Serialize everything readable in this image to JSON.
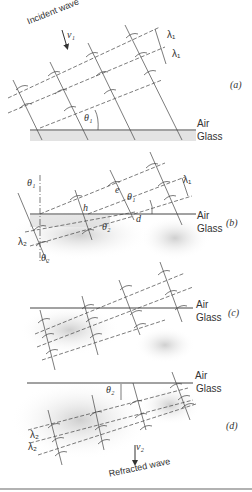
{
  "figure": {
    "panels": [
      {
        "id": "a",
        "tag": "(a)",
        "air": "Air",
        "glass": "Glass"
      },
      {
        "id": "b",
        "tag": "(b)",
        "air": "Air",
        "glass": "Glass"
      },
      {
        "id": "c",
        "tag": "(c)",
        "air": "Air",
        "glass": "Glass"
      },
      {
        "id": "d",
        "tag": "(d)",
        "air": "Air",
        "glass": "Glass"
      }
    ],
    "labels": {
      "incident_wave": "Incident wave",
      "refracted_wave": "Refracted wave",
      "v1": "v₁",
      "v2": "v₂",
      "lambda1": "λ₁",
      "lambda2": "λ₂",
      "theta1": "θ₁",
      "theta2": "θ₂",
      "point_h": "h",
      "point_e": "e",
      "point_d": "d"
    },
    "colors": {
      "line": "#333333",
      "glass_shade": "#d9d9d9",
      "rule": "#999999"
    }
  }
}
